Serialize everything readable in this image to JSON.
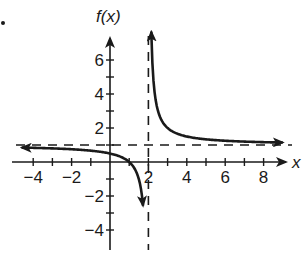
{
  "chart_data": {
    "type": "line",
    "title": "",
    "function": "f(x) = 1/(x - 2) + 1",
    "xlabel": "x",
    "ylabel": "f(x)",
    "xlim": [
      -4.5,
      9
    ],
    "ylim": [
      -5,
      7
    ],
    "x_ticks": [
      -4,
      -3,
      -2,
      -1,
      1,
      2,
      3,
      4,
      5,
      6,
      7,
      8
    ],
    "x_tick_labels": [
      "-4",
      "-2",
      "2",
      "4",
      "6",
      "8"
    ],
    "x_tick_label_values": [
      -4,
      -2,
      2,
      4,
      6,
      8
    ],
    "y_ticks": [
      -4,
      -3,
      -2,
      -1,
      1,
      2,
      3,
      4,
      5,
      6
    ],
    "y_tick_labels": [
      "6",
      "4",
      "2",
      "-2",
      "-4"
    ],
    "y_tick_label_values": [
      6,
      4,
      2,
      -2,
      -4
    ],
    "grid": false,
    "legend": null,
    "asymptotes": {
      "vertical": {
        "x": 2,
        "style": "dashed"
      },
      "horizontal": {
        "y": 1,
        "style": "dashed"
      }
    },
    "series": [
      {
        "name": "left branch",
        "x": [
          -4,
          -3,
          -2,
          -1,
          0,
          1,
          1.5,
          1.75
        ],
        "y": [
          0.83,
          0.8,
          0.75,
          0.67,
          0.5,
          0,
          -1,
          -3
        ],
        "arrows": "both"
      },
      {
        "name": "right branch",
        "x": [
          2.17,
          2.25,
          2.5,
          3,
          4,
          5,
          6,
          7,
          8,
          9
        ],
        "y": [
          7,
          5,
          3,
          2,
          1.5,
          1.33,
          1.25,
          1.2,
          1.17,
          1.14
        ],
        "arrows": "both"
      }
    ]
  }
}
